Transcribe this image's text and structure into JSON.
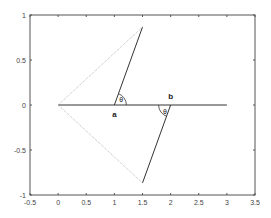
{
  "chart_data": {
    "type": "line",
    "title": "",
    "xlabel": "",
    "ylabel": "",
    "xlim": [
      -0.5,
      3.5
    ],
    "ylim": [
      -1,
      1
    ],
    "x_ticks": [
      "-0.5",
      "0",
      "0.5",
      "1",
      "1.5",
      "2",
      "2.5",
      "3",
      "3.5"
    ],
    "y_ticks": [
      "-1",
      "-0.5",
      "0",
      "0.5",
      "1"
    ],
    "grid": false,
    "series": [
      {
        "name": "axis-line",
        "color": "#333333",
        "x": [
          0,
          3
        ],
        "y": [
          0,
          0
        ]
      },
      {
        "name": "segment-a",
        "color": "#333333",
        "x": [
          1,
          1.5
        ],
        "y": [
          0,
          0.866
        ]
      },
      {
        "name": "segment-b",
        "color": "#333333",
        "x": [
          2,
          1.5
        ],
        "y": [
          0,
          -0.866
        ]
      },
      {
        "name": "dotted-upper",
        "color": "#aaaaaa",
        "style": "dotted",
        "x": [
          0,
          1.5
        ],
        "y": [
          0,
          0.866
        ]
      },
      {
        "name": "dotted-lower",
        "color": "#aaaaaa",
        "style": "dotted",
        "x": [
          0,
          1.5
        ],
        "y": [
          0,
          -0.866
        ]
      }
    ],
    "annotations": [
      {
        "text": "a",
        "x": 1,
        "y": -0.1
      },
      {
        "text": "b",
        "x": 2,
        "y": 0.1
      },
      {
        "text": "θ",
        "x": 1.12,
        "y": 0.07
      },
      {
        "text": "θ",
        "x": 1.9,
        "y": -0.07
      }
    ]
  }
}
